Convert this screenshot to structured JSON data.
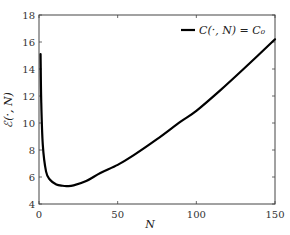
{
  "chart_data": {
    "type": "line",
    "title": "",
    "xlabel": "N",
    "ylabel": "ℰ(·, N)",
    "xlim": [
      0,
      150
    ],
    "ylim": [
      4,
      18
    ],
    "xticks": [
      0,
      50,
      100,
      150
    ],
    "yticks": [
      4,
      6,
      8,
      10,
      12,
      14,
      16,
      18
    ],
    "grid": false,
    "legend_position": "upper right",
    "series": [
      {
        "name": "C(·, N) = C₀",
        "color": "#000000",
        "x": [
          1,
          1.4,
          2.4,
          4.5,
          7,
          11,
          15,
          18,
          22,
          30,
          39,
          50,
          60,
          75,
          90,
          100,
          115,
          130,
          150
        ],
        "y": [
          15.1,
          11.7,
          8.4,
          6.4,
          5.8,
          5.45,
          5.35,
          5.33,
          5.38,
          5.7,
          6.3,
          6.9,
          7.6,
          8.8,
          10.1,
          10.9,
          12.4,
          14.0,
          16.2
        ]
      }
    ]
  }
}
